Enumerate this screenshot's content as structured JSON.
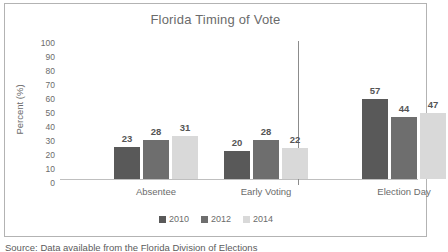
{
  "figure": {
    "source_note": "Source: Data available from the Florida Division of Elections"
  },
  "chart_data": {
    "type": "bar",
    "title": "Florida Timing of Vote",
    "xlabel": "",
    "ylabel": "Percent (%)",
    "ylim": [
      0,
      100
    ],
    "ytick_step": 10,
    "yticks": [
      "100",
      "90",
      "80",
      "70",
      "60",
      "50",
      "40",
      "30",
      "20",
      "10",
      "0"
    ],
    "grid": false,
    "legend_position": "bottom",
    "categories": [
      "Absentee",
      "Early Voting",
      "Election Day"
    ],
    "series": [
      {
        "name": "2010",
        "color": "#595959",
        "values": [
          23,
          20,
          57
        ]
      },
      {
        "name": "2012",
        "color": "#6e6e6e",
        "values": [
          28,
          28,
          44
        ]
      },
      {
        "name": "2014",
        "color": "#d9d9d9",
        "values": [
          31,
          22,
          47
        ]
      }
    ],
    "annotations": {
      "separator_before_category": "Election Day"
    }
  }
}
